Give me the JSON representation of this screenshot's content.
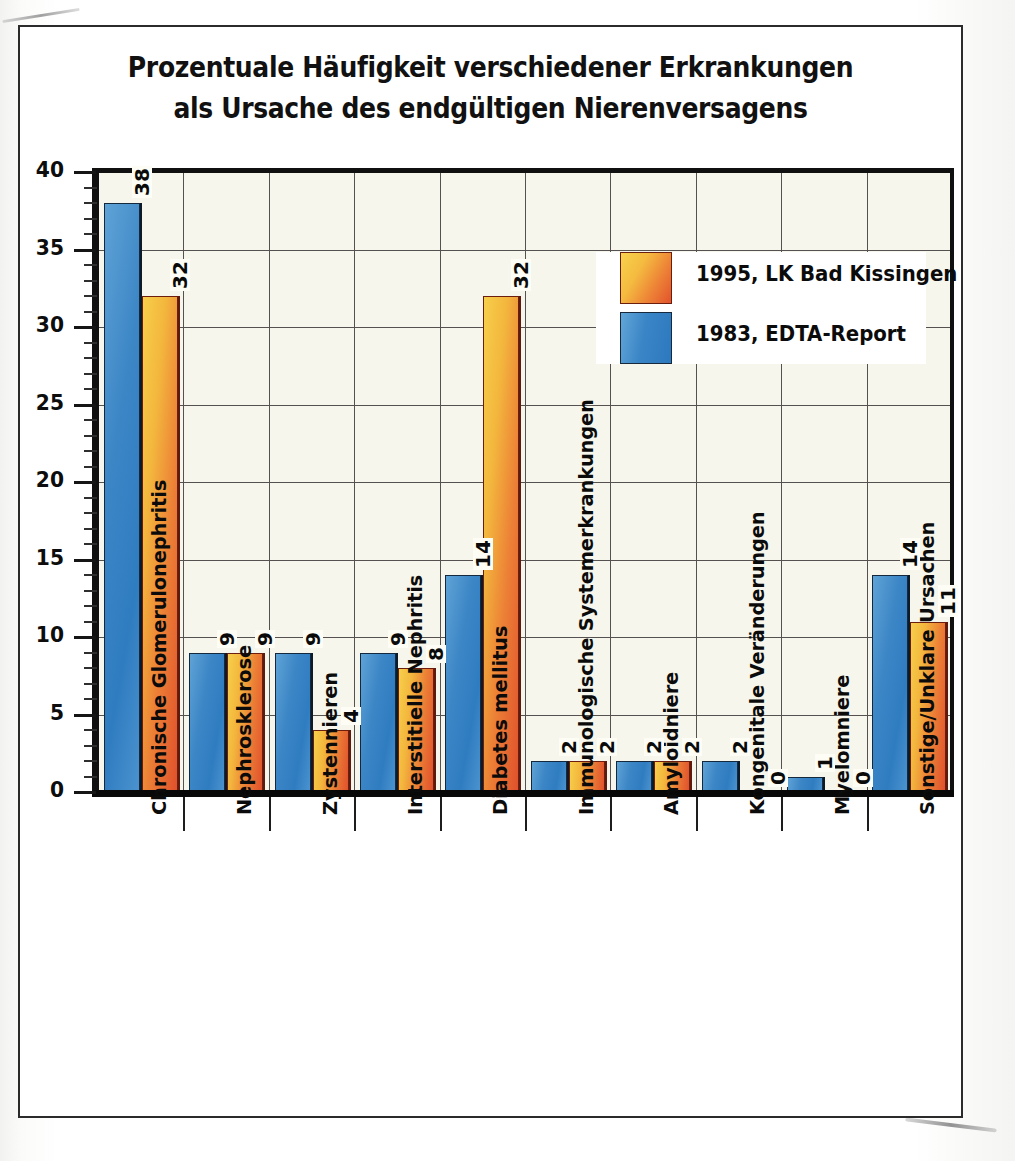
{
  "chart_data": {
    "type": "bar",
    "title": "Prozentuale Häufigkeit verschiedener Erkrankungen als Ursache des endgültigen Nierenversagens",
    "title_lines": [
      "Prozentuale Häufigkeit verschiedener Erkrankungen",
      "als Ursache des endgültigen Nierenversagens"
    ],
    "xlabel": "",
    "ylabel": "",
    "ylim": [
      0,
      40
    ],
    "ytick_step": 5,
    "yminor_step": 1,
    "grid": true,
    "legend_position": "inside-top-right",
    "categories": [
      "Chronische Glomerulonephritis",
      "Nephrosklerose",
      "Zystennieren",
      "Interstitielle Nephritis",
      "Diabetes mellitus",
      "Immunologische Systemerkrankungen",
      "Amyloidniere",
      "Kongenitale Veränderungen",
      "Myelomniere",
      "Sonstige/Unklare Ursachen"
    ],
    "yticks": [
      "0",
      "5",
      "10",
      "15",
      "20",
      "25",
      "30",
      "35",
      "40"
    ],
    "series": [
      {
        "name": "1983, EDTA-Report",
        "color": "#3a85c6",
        "values": [
          38,
          9,
          9,
          9,
          14,
          2,
          2,
          2,
          1,
          14
        ],
        "labels": [
          "38",
          "9",
          "9",
          "9",
          "14",
          "2",
          "2",
          "2",
          "1",
          "14"
        ]
      },
      {
        "name": "1995, LK Bad Kissingen",
        "color": "#ed8336",
        "values": [
          32,
          9,
          4,
          8,
          32,
          2,
          2,
          0,
          0,
          11
        ],
        "labels": [
          "32",
          "9",
          "4",
          "8",
          "32",
          "2",
          "2",
          "0",
          "0",
          "11"
        ]
      }
    ],
    "legend": [
      {
        "label": "1995, LK Bad Kissingen",
        "color": "#ed8336"
      },
      {
        "label": "1983, EDTA-Report",
        "color": "#3a85c6"
      }
    ]
  }
}
